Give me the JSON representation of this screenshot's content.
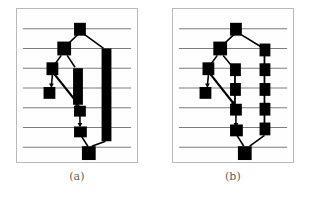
{
  "figure": {
    "name": "layered-graph-drawing-comparison",
    "background": "#ffffff",
    "width": 312,
    "height": 199,
    "panel_border_color": "#b9b9b9",
    "panel_fill": "#fefefe",
    "layer_line_color": "#7c7c7c",
    "node_color": "#000000",
    "edge_color": "#000000"
  },
  "panels": [
    {
      "id": "a",
      "caption": "(a)",
      "description": "Layered drawing in which long edges spanning several layers are drawn as single thick vertical bars.",
      "layer_lines_y": [
        20,
        40,
        60,
        80,
        100,
        120,
        140
      ],
      "layer_count": 7,
      "nodes": [
        {
          "id": "n0",
          "x": 64,
          "y": 20,
          "w": 11,
          "h": 13,
          "layer": 1
        },
        {
          "id": "n1",
          "x": 47,
          "y": 40,
          "w": 13,
          "h": 14,
          "layer": 2
        },
        {
          "id": "n2",
          "x": 35,
          "y": 60,
          "w": 11,
          "h": 13,
          "layer": 3
        },
        {
          "id": "n3",
          "x": 32,
          "y": 80,
          "w": 11,
          "h": 12,
          "layer": 4
        },
        {
          "id": "n4",
          "x": 59,
          "y": 100,
          "w": 11,
          "h": 12,
          "layer": 5
        },
        {
          "id": "n5",
          "x": 59,
          "y": 120,
          "w": 12,
          "h": 12,
          "layer": 6
        },
        {
          "id": "n6",
          "x": 66,
          "y": 141,
          "w": 13,
          "h": 14,
          "layer": 7
        }
      ],
      "long_edge_bars": [
        {
          "id": "bar-right",
          "x": 86,
          "y_top": 40,
          "y_bottom": 134,
          "width": 10,
          "spans_layers": "2-7"
        },
        {
          "id": "bar-mid",
          "x": 57,
          "y_top": 60,
          "y_bottom": 96,
          "width": 10,
          "spans_layers": "3-5"
        }
      ],
      "edges": [
        {
          "from": "n0",
          "to": "n1",
          "type": "straight"
        },
        {
          "from": "n0",
          "to": "bar-right",
          "type": "straight"
        },
        {
          "from": "n1",
          "to": "n2",
          "type": "straight"
        },
        {
          "from": "n1",
          "to": "bar-mid",
          "type": "straight"
        },
        {
          "from": "n2",
          "to": "n3",
          "type": "short-arrow"
        },
        {
          "from": "n2",
          "to": "n4",
          "type": "long-diagonal-arrow"
        },
        {
          "from": "bar-mid",
          "to": "n4",
          "type": "straight"
        },
        {
          "from": "n4",
          "to": "n5",
          "type": "short-arrow"
        },
        {
          "from": "n5",
          "to": "n6",
          "type": "straight"
        },
        {
          "from": "bar-right",
          "to": "n6",
          "type": "straight"
        }
      ]
    },
    {
      "id": "b",
      "caption": "(b)",
      "description": "Same layered drawing in which long edges are replaced by chains of dummy nodes, one per intermediate layer.",
      "layer_lines_y": [
        20,
        40,
        60,
        80,
        100,
        120,
        140
      ],
      "layer_count": 7,
      "nodes": [
        {
          "id": "m0",
          "x": 64,
          "y": 20,
          "w": 11,
          "h": 13,
          "layer": 1
        },
        {
          "id": "m1",
          "x": 47,
          "y": 40,
          "w": 13,
          "h": 14,
          "layer": 2
        },
        {
          "id": "m2",
          "x": 35,
          "y": 60,
          "w": 11,
          "h": 13,
          "layer": 3
        },
        {
          "id": "m3",
          "x": 32,
          "y": 80,
          "w": 11,
          "h": 12,
          "layer": 4
        },
        {
          "id": "m4",
          "x": 59,
          "y": 100,
          "w": 11,
          "h": 12,
          "layer": 5
        },
        {
          "id": "m5",
          "x": 59,
          "y": 120,
          "w": 12,
          "h": 12,
          "layer": 6
        },
        {
          "id": "m6",
          "x": 66,
          "y": 141,
          "w": 13,
          "h": 14,
          "layer": 7
        }
      ],
      "dummy_chain_right": {
        "id": "chain-right",
        "x": 88,
        "node_w": 10,
        "node_h": 13,
        "layers_y": [
          40,
          60,
          80,
          100,
          120
        ],
        "spans_layers": "2-7"
      },
      "dummy_chain_mid": {
        "id": "chain-mid",
        "x": 58,
        "node_w": 10,
        "node_h": 13,
        "layers_y": [
          60,
          80
        ],
        "spans_layers": "3-5"
      },
      "edges": [
        {
          "from": "m0",
          "to": "m1",
          "type": "straight"
        },
        {
          "from": "m0",
          "to": "chain-right",
          "type": "straight"
        },
        {
          "from": "m1",
          "to": "m2",
          "type": "straight"
        },
        {
          "from": "m1",
          "to": "chain-mid",
          "type": "straight"
        },
        {
          "from": "m2",
          "to": "m3",
          "type": "short-arrow"
        },
        {
          "from": "m2",
          "to": "m4",
          "type": "long-diagonal-arrow"
        },
        {
          "from": "chain-mid",
          "to": "m4",
          "type": "straight"
        },
        {
          "from": "m4",
          "to": "m5",
          "type": "short-arrow"
        },
        {
          "from": "m5",
          "to": "m6",
          "type": "straight"
        },
        {
          "from": "chain-right",
          "to": "m6",
          "type": "straight"
        }
      ]
    }
  ]
}
